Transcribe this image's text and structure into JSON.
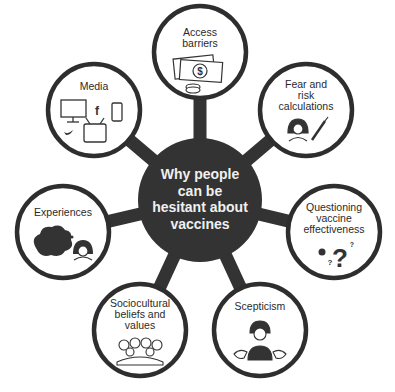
{
  "diagram": {
    "center": {
      "label_lines": [
        "Why people",
        "can be",
        "hesitant about",
        "vaccines"
      ],
      "color": "#333333"
    },
    "nodes": [
      {
        "id": "access-barriers",
        "label_lines": [
          "Access",
          "barriers"
        ],
        "icon": "money-icon"
      },
      {
        "id": "media",
        "label_lines": [
          "Media"
        ],
        "icon": "media-devices-icon"
      },
      {
        "id": "fear-risk",
        "label_lines": [
          "Fear and",
          "risk",
          "calculations"
        ],
        "icon": "worried-person-syringe-icon"
      },
      {
        "id": "experiences",
        "label_lines": [
          "Experiences"
        ],
        "icon": "thought-bubble-person-icon"
      },
      {
        "id": "questioning",
        "label_lines": [
          "Questioning",
          "vaccine",
          "effectiveness"
        ],
        "icon": "question-marks-icon"
      },
      {
        "id": "sociocultural",
        "label_lines": [
          "Sociocultural",
          "beliefs and",
          "values"
        ],
        "icon": "group-of-people-icon"
      },
      {
        "id": "scepticism",
        "label_lines": [
          "Scepticism"
        ],
        "icon": "shrugging-person-icon"
      }
    ],
    "media_icons": {
      "facebook": "f"
    },
    "question_icon": {
      "big": "?",
      "small1": "?",
      "small2": "?"
    },
    "money_icon": {
      "symbol": "$"
    }
  }
}
